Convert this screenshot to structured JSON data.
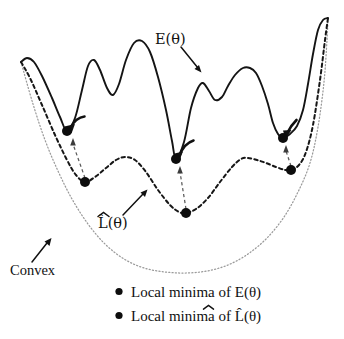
{
  "figure": {
    "labels": {
      "energy_curve": "E(θ)",
      "surrogate_curve": "L̂(θ)",
      "surrogate_base": "L",
      "surrogate_arg": "(θ)",
      "convex": "Convex"
    },
    "legend": [
      {
        "marker": "filled-circle",
        "text": "Local minima of E(θ)"
      },
      {
        "marker": "filled-circle",
        "text": "Local minima of L̂(θ)"
      }
    ],
    "legend_items_parts": [
      {
        "prefix": "Local minima of ",
        "symbol": "E(θ)"
      },
      {
        "prefix": "Local minima of ",
        "symbol": "L̂(θ)"
      }
    ],
    "colors": {
      "solid_curve": "#141414",
      "dashed_curve": "#161616",
      "dotted_convex": "#9a9a9a",
      "dot_fill": "#0d0d0d",
      "arrow_gray": "#5a5a5a",
      "background": "#ffffff"
    }
  },
  "chart_data": {
    "type": "line",
    "xlabel": "",
    "ylabel": "",
    "xlim": [
      0,
      344
    ],
    "ylim": [
      339,
      0
    ],
    "grid": false,
    "legend_position": "bottom-center",
    "note": "y axis is inverted in pixel space: smaller y = higher energy",
    "series": [
      {
        "name": "E(θ)",
        "style": "solid",
        "points": [
          [
            21,
            62
          ],
          [
            27,
            58
          ],
          [
            34,
            62
          ],
          [
            42,
            76
          ],
          [
            52,
            98
          ],
          [
            60,
            117
          ],
          [
            67,
            131
          ],
          [
            75,
            118
          ],
          [
            82,
            90
          ],
          [
            88,
            66
          ],
          [
            94,
            60
          ],
          [
            100,
            70
          ],
          [
            107,
            88
          ],
          [
            113,
            95
          ],
          [
            119,
            84
          ],
          [
            126,
            60
          ],
          [
            134,
            43
          ],
          [
            142,
            41
          ],
          [
            150,
            52
          ],
          [
            158,
            77
          ],
          [
            166,
            110
          ],
          [
            172,
            141
          ],
          [
            176,
            159
          ],
          [
            184,
            142
          ],
          [
            191,
            108
          ],
          [
            198,
            88
          ],
          [
            203,
            83
          ],
          [
            209,
            91
          ],
          [
            215,
            100
          ],
          [
            222,
            97
          ],
          [
            228,
            86
          ],
          [
            235,
            75
          ],
          [
            243,
            68
          ],
          [
            250,
            68
          ],
          [
            256,
            73
          ],
          [
            262,
            86
          ],
          [
            268,
            104
          ],
          [
            273,
            123
          ],
          [
            278,
            134
          ],
          [
            283,
            138
          ],
          [
            290,
            134
          ],
          [
            297,
            126
          ],
          [
            303,
            110
          ],
          [
            308,
            84
          ],
          [
            313,
            54
          ],
          [
            318,
            30
          ],
          [
            323,
            20
          ],
          [
            328,
            18
          ]
        ]
      },
      {
        "name": "L̂(θ)",
        "style": "dashed",
        "points": [
          [
            21,
            62
          ],
          [
            30,
            78
          ],
          [
            42,
            105
          ],
          [
            55,
            135
          ],
          [
            67,
            160
          ],
          [
            76,
            175
          ],
          [
            85,
            182
          ],
          [
            95,
            177
          ],
          [
            106,
            168
          ],
          [
            116,
            160
          ],
          [
            125,
            157
          ],
          [
            135,
            160
          ],
          [
            146,
            172
          ],
          [
            158,
            190
          ],
          [
            170,
            205
          ],
          [
            179,
            212
          ],
          [
            186,
            213
          ],
          [
            196,
            209
          ],
          [
            208,
            198
          ],
          [
            220,
            182
          ],
          [
            232,
            167
          ],
          [
            241,
            159
          ],
          [
            248,
            158
          ],
          [
            257,
            160
          ],
          [
            266,
            163
          ],
          [
            276,
            167
          ],
          [
            285,
            170
          ],
          [
            291,
            170
          ],
          [
            299,
            165
          ],
          [
            306,
            152
          ],
          [
            313,
            125
          ],
          [
            320,
            80
          ],
          [
            325,
            40
          ],
          [
            328,
            18
          ]
        ]
      },
      {
        "name": "Convex",
        "style": "dotted",
        "points": [
          [
            21,
            62
          ],
          [
            33,
            104
          ],
          [
            45,
            140
          ],
          [
            58,
            171
          ],
          [
            72,
            199
          ],
          [
            88,
            224
          ],
          [
            105,
            244
          ],
          [
            124,
            259
          ],
          [
            144,
            268
          ],
          [
            165,
            272
          ],
          [
            186,
            273
          ],
          [
            207,
            271
          ],
          [
            228,
            265
          ],
          [
            248,
            254
          ],
          [
            267,
            238
          ],
          [
            284,
            217
          ],
          [
            298,
            192
          ],
          [
            310,
            163
          ],
          [
            318,
            127
          ],
          [
            324,
            82
          ],
          [
            327,
            40
          ],
          [
            328,
            18
          ]
        ]
      }
    ],
    "markers": {
      "minima_E": [
        {
          "x": 67,
          "y": 131
        },
        {
          "x": 176,
          "y": 159
        },
        {
          "x": 283,
          "y": 138
        }
      ],
      "minima_Lhat": [
        {
          "x": 85,
          "y": 182
        },
        {
          "x": 186,
          "y": 213
        },
        {
          "x": 291,
          "y": 170
        }
      ]
    },
    "annotations": [
      {
        "text": "E(θ)",
        "x": 175,
        "y": 40,
        "arrow_to": [
          200,
          72
        ]
      },
      {
        "text": "L̂(θ)",
        "x": 118,
        "y": 222,
        "arrow_to": [
          148,
          189
        ]
      },
      {
        "text": "Convex",
        "x": 13,
        "y": 270,
        "arrow_to": [
          50,
          237
        ]
      }
    ],
    "correspondence_arrows": [
      {
        "from": [
          85,
          178
        ],
        "to": [
          73,
          138
        ],
        "label": ""
      },
      {
        "from": [
          186,
          209
        ],
        "to": [
          180,
          166
        ],
        "label": ""
      },
      {
        "from": [
          291,
          166
        ],
        "to": [
          286,
          145
        ],
        "label": ""
      }
    ]
  }
}
